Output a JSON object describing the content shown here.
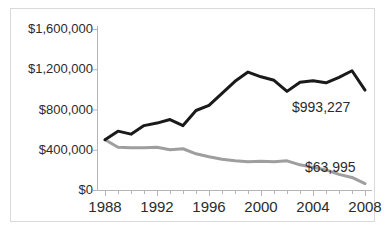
{
  "chart_data": {
    "type": "line",
    "title": "",
    "subtitle": "",
    "xlabel": "",
    "ylabel": "",
    "xlim": [
      1988,
      2008
    ],
    "ylim": [
      0,
      1600000
    ],
    "grid": false,
    "legend_position": "none",
    "x": [
      1988,
      1989,
      1990,
      1991,
      1992,
      1993,
      1994,
      1995,
      1996,
      1997,
      1998,
      1999,
      2000,
      2001,
      2002,
      2003,
      2004,
      2005,
      2006,
      2007,
      2008
    ],
    "y_ticks": [
      0,
      400000,
      800000,
      1200000,
      1600000
    ],
    "y_tick_labels": [
      "$0",
      "$400,000",
      "$800,000",
      "$1,200,000",
      "$1,600,000"
    ],
    "x_ticks": [
      1988,
      1992,
      1996,
      2000,
      2004,
      2008
    ],
    "x_tick_labels": [
      "1988",
      "1992",
      "1996",
      "2000",
      "2004",
      "2008"
    ],
    "x_minor_ticks_every": 1,
    "series": [
      {
        "name": "black-series",
        "color": "#1a1a1a",
        "line_width": 3,
        "values": [
          500000,
          585000,
          555000,
          640000,
          665000,
          700000,
          640000,
          790000,
          840000,
          960000,
          1080000,
          1172000,
          1125000,
          1090000,
          980000,
          1070000,
          1085000,
          1065000,
          1120000,
          1185000,
          993227
        ],
        "end_label": "$993,227"
      },
      {
        "name": "gray-series",
        "color": "#9e9e9e",
        "line_width": 3,
        "values": [
          500000,
          425000,
          420000,
          420000,
          425000,
          400000,
          410000,
          360000,
          330000,
          305000,
          290000,
          280000,
          285000,
          280000,
          290000,
          250000,
          225000,
          200000,
          155000,
          125000,
          63995
        ],
        "end_label": "$63,995"
      }
    ],
    "annotations": [
      {
        "text": "$993,227",
        "series": "black-series"
      },
      {
        "text": "$63,995",
        "series": "gray-series"
      }
    ]
  },
  "axis": {
    "y_labels": [
      "$1,600,000",
      "$1,200,000",
      "$800,000",
      "$400,000",
      "$0"
    ],
    "x_labels": [
      "1988",
      "1992",
      "1996",
      "2000",
      "2004",
      "2008"
    ]
  },
  "labels": {
    "black_end": "$993,227",
    "gray_end": "$63,995"
  },
  "colors": {
    "black_series": "#1a1a1a",
    "gray_series": "#9e9e9e",
    "axis": "#b5b5b5",
    "text": "#2b2b2b",
    "border": "#d9d9d9",
    "background": "#ffffff"
  }
}
